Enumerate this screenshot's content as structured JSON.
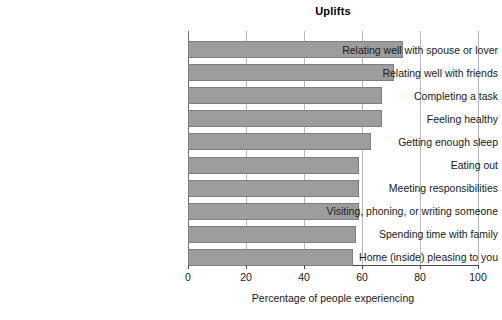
{
  "chart_data": {
    "type": "bar",
    "orientation": "horizontal",
    "title": "Uplifts",
    "xlabel": "Percentage of people experiencing",
    "ylabel": "",
    "xlim": [
      0,
      100
    ],
    "xticks": [
      0,
      20,
      40,
      60,
      80,
      100
    ],
    "xtick_labels": [
      "0",
      "20",
      "40",
      "60",
      "80",
      "100"
    ],
    "grid": "vertical",
    "legend": "none",
    "bar_color": "#9d9d9d",
    "bar_border_color": "#7e7e7e",
    "categories": [
      "Relating well with spouse or lover",
      "Relating well with friends",
      "Completing a task",
      "Feeling healthy",
      "Getting enough sleep",
      "Eating out",
      "Meeting responsibilities",
      "Visiting, phoning, or writing someone",
      "Spending time with family",
      "Home (inside) pleasing to you"
    ],
    "values": [
      74,
      71,
      67,
      67,
      63,
      59,
      59,
      59,
      58,
      57
    ]
  }
}
